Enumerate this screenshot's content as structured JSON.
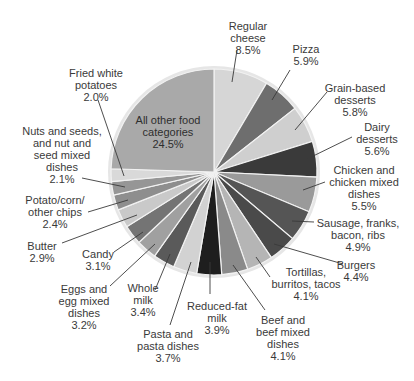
{
  "chart_data": {
    "type": "pie",
    "title": "",
    "start_angle_deg": 0,
    "direction": "clockwise",
    "center": [
      214,
      172
    ],
    "radius": 104,
    "slices": [
      {
        "label": "Regular cheese",
        "value": 8.5,
        "display": "Regular\ncheese\n8.5%",
        "color": "#d6d6d6",
        "label_pos": [
          248,
          20
        ],
        "line": [
          [
            237,
            50
          ],
          [
            232,
            82
          ]
        ]
      },
      {
        "label": "Pizza",
        "value": 5.9,
        "display": "Pizza\n5.9%",
        "color": "#6e6e6e",
        "label_pos": [
          306,
          43
        ],
        "line": [
          [
            290,
            70
          ],
          [
            272,
            100
          ]
        ]
      },
      {
        "label": "Grain-based desserts",
        "value": 5.8,
        "display": "Grain-based\ndesserts\n5.8%",
        "color": "#cfcfcf",
        "label_pos": [
          355,
          82
        ],
        "line": [
          [
            327,
            92
          ],
          [
            295,
            130
          ]
        ]
      },
      {
        "label": "Dairy desserts",
        "value": 5.6,
        "display": "Dairy\ndesserts\n5.6%",
        "color": "#3a3a3a",
        "label_pos": [
          377,
          121
        ],
        "line": [
          [
            352,
            137
          ],
          [
            305,
            160
          ]
        ]
      },
      {
        "label": "Chicken and chicken mixed dishes",
        "value": 5.5,
        "display": "Chicken and\nchicken mixed\ndishes\n5.5%",
        "color": "#9a9a9a",
        "label_pos": [
          364,
          164
        ],
        "line": [
          [
            325,
            182
          ],
          [
            303,
            190
          ]
        ]
      },
      {
        "label": "Sausage, franks, bacon, ribs",
        "value": 4.9,
        "display": "Sausage, franks,\nbacon, ribs\n4.9%",
        "color": "#555555",
        "label_pos": [
          358,
          217
        ],
        "line": [
          [
            314,
            222
          ],
          [
            292,
            221
          ]
        ]
      },
      {
        "label": "Burgers",
        "value": 4.4,
        "display": "Burgers\n4.4%",
        "color": "#4a4a4a",
        "label_pos": [
          356,
          259
        ],
        "line": [
          [
            343,
            264
          ],
          [
            274,
            244
          ]
        ]
      },
      {
        "label": "Tortillas, burritos, tacos",
        "value": 4.1,
        "display": "Tortillas,\nburritos, tacos\n4.1%",
        "color": "#b5b5b5",
        "label_pos": [
          306,
          266
        ],
        "line": [
          [
            270,
            277
          ],
          [
            256,
            257
          ]
        ]
      },
      {
        "label": "Beef and beef mixed dishes",
        "value": 4.1,
        "display": "Beef and\nbeef mixed\ndishes\n4.1%",
        "color": "#8a8a8a",
        "label_pos": [
          283,
          314
        ],
        "line": [
          [
            265,
            310
          ],
          [
            233,
            265
          ]
        ]
      },
      {
        "label": "Reduced-fat milk",
        "value": 3.9,
        "display": "Reduced-fat\nmilk\n3.9%",
        "color": "#1e1e1e",
        "label_pos": [
          217,
          300
        ],
        "line": [
          [
            210,
            294
          ],
          [
            210,
            262
          ]
        ]
      },
      {
        "label": "Pasta and pasta dishes",
        "value": 3.7,
        "display": "Pasta and\npasta dishes\n3.7%",
        "color": "#d2d2d2",
        "label_pos": [
          168,
          328
        ],
        "line": [
          [
            170,
            325
          ],
          [
            191,
            262
          ]
        ]
      },
      {
        "label": "Whole milk",
        "value": 3.4,
        "display": "Whole\nmilk\n3.4%",
        "color": "#5a5a5a",
        "label_pos": [
          143,
          282
        ],
        "line": [
          [
            155,
            290
          ],
          [
            170,
            254
          ]
        ]
      },
      {
        "label": "Eggs and egg mixed dishes",
        "value": 3.2,
        "display": "Eggs and\negg mixed\ndishes\n3.2%",
        "color": "#a0a0a0",
        "label_pos": [
          84,
          283
        ],
        "line": [
          [
            110,
            286
          ],
          [
            155,
            244
          ]
        ]
      },
      {
        "label": "Candy",
        "value": 3.1,
        "display": "Candy\n3.1%",
        "color": "#747474",
        "label_pos": [
          98,
          248
        ],
        "line": [
          [
            114,
            252
          ],
          [
            143,
            232
          ]
        ]
      },
      {
        "label": "Butter",
        "value": 2.9,
        "display": "Butter\n2.9%",
        "color": "#c9c9c9",
        "label_pos": [
          42,
          240
        ],
        "line": [
          [
            62,
            243
          ],
          [
            137,
            215
          ]
        ]
      },
      {
        "label": "Potato/corn/other chips",
        "value": 2.4,
        "display": "Potato/corn/\nother chips\n2.4%",
        "color": "#8e8e8e",
        "label_pos": [
          55,
          194
        ],
        "line": [
          [
            88,
            212
          ],
          [
            128,
            200
          ]
        ]
      },
      {
        "label": "Nuts and seeds, and nut and seed mixed dishes",
        "value": 2.1,
        "display": "Nuts and seeds,\nand nut and\nseed mixed\ndishes\n2.1%",
        "color": "#969696",
        "label_pos": [
          62,
          125
        ],
        "line": [
          [
            82,
            178
          ],
          [
            125,
            187
          ]
        ]
      },
      {
        "label": "Fried white potatoes",
        "value": 2.0,
        "display": "Fried white\npotatoes\n2.0%",
        "color": "#d9d9d9",
        "label_pos": [
          96,
          67
        ],
        "line": [
          [
            98,
            100
          ],
          [
            124,
            176
          ]
        ]
      },
      {
        "label": "All other food categories",
        "value": 24.5,
        "display": "All other food\ncategories\n24.5%",
        "color": "#a9a9a9",
        "label_pos": [
          168,
          114
        ],
        "line": null,
        "inside": true
      }
    ],
    "outer_ring_color": "#e6e6e6",
    "separator_color": "#f2f2f2",
    "label_color": "#3a3a3a",
    "leader_line_color": "#3a3a3a"
  }
}
